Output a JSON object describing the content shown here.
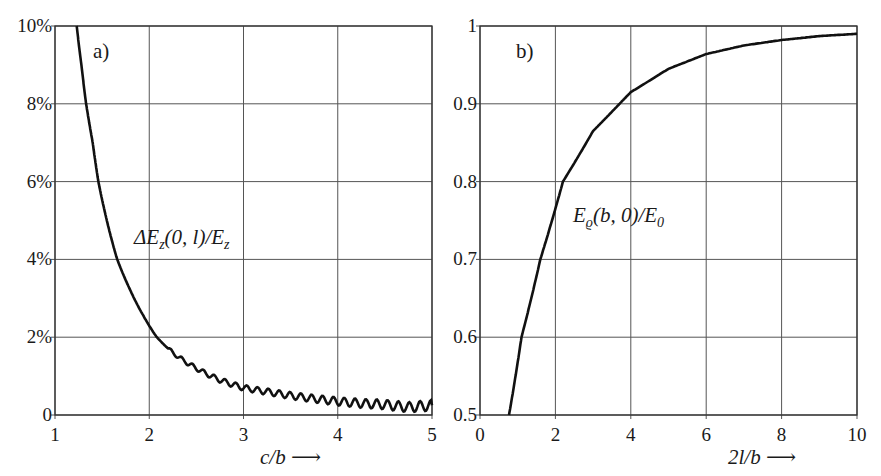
{
  "chart_data": [
    {
      "id": "a",
      "type": "line",
      "panel_label": "a)",
      "title": "",
      "xlabel": "c/b ⟶",
      "ylabel": "",
      "curve_label": "ΔE_z(0,l)/E_z",
      "curve_label_parts": {
        "pre": "ΔE",
        "sub1": "z",
        "mid": "(0, l)/E",
        "sub2": "z"
      },
      "xlim": [
        1,
        5
      ],
      "ylim": [
        0,
        10
      ],
      "x_ticks": [
        1,
        2,
        3,
        4,
        5
      ],
      "x_tick_labels": [
        "1",
        "2",
        "3",
        "4",
        "5"
      ],
      "y_ticks": [
        0,
        2,
        4,
        6,
        8,
        10
      ],
      "y_tick_labels": [
        "0",
        "2%",
        "4%",
        "6%",
        "8%",
        "10%"
      ],
      "grid": true,
      "note": "curve shows small oscillations (ripple) for c/b > ~2.2",
      "series": [
        {
          "name": "ΔE_z(0,l)/E_z",
          "x": [
            1.23,
            1.28,
            1.33,
            1.4,
            1.46,
            1.55,
            1.66,
            1.8,
            1.95,
            2.08,
            2.25,
            2.5,
            2.75,
            3.0,
            3.25,
            3.5,
            3.75,
            4.0,
            4.25,
            4.5,
            4.75,
            5.0
          ],
          "y": [
            10.0,
            9.0,
            8.0,
            7.0,
            6.0,
            5.0,
            4.0,
            3.2,
            2.5,
            2.0,
            1.6,
            1.2,
            0.9,
            0.7,
            0.6,
            0.5,
            0.42,
            0.35,
            0.3,
            0.27,
            0.2,
            0.25
          ]
        }
      ]
    },
    {
      "id": "b",
      "type": "line",
      "panel_label": "b)",
      "title": "",
      "xlabel": "2l/b ⟶",
      "ylabel": "",
      "curve_label": "E_ϱ(b,0)/E_0",
      "curve_label_parts": {
        "pre": "E",
        "sub1": "ϱ",
        "mid": "(b, 0)/E",
        "sub2": "0"
      },
      "xlim": [
        0,
        10
      ],
      "ylim": [
        0.5,
        1.0
      ],
      "x_ticks": [
        0,
        2,
        4,
        6,
        8,
        10
      ],
      "x_tick_labels": [
        "0",
        "2",
        "4",
        "6",
        "8",
        "10"
      ],
      "y_ticks": [
        0.5,
        0.6,
        0.7,
        0.8,
        0.9,
        1.0
      ],
      "y_tick_labels": [
        "0.5",
        "0.6",
        "0.7",
        "0.8",
        "0.9",
        "1"
      ],
      "grid": true,
      "series": [
        {
          "name": "E_ϱ(b,0)/E_0",
          "x": [
            0.77,
            1.1,
            1.6,
            2.2,
            3.0,
            3.7,
            4.0,
            5.0,
            6.0,
            7.0,
            8.0,
            9.0,
            10.0
          ],
          "y": [
            0.5,
            0.6,
            0.7,
            0.8,
            0.865,
            0.9,
            0.915,
            0.945,
            0.964,
            0.975,
            0.982,
            0.987,
            0.99
          ]
        }
      ]
    }
  ]
}
